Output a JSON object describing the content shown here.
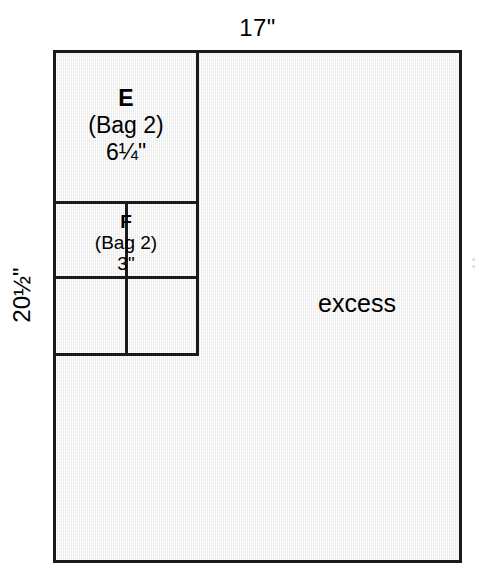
{
  "diagram": {
    "type": "cutting-layout",
    "material": {
      "width_label": "17\"",
      "height_label": "20½\"",
      "fill_color": "#ebebeb",
      "border_color": "#1a1a1a"
    },
    "pieces": [
      {
        "id": "E",
        "bag": "(Bag 2)",
        "size": "6¼\"",
        "shape": "square",
        "count": 1,
        "position": "top-left"
      },
      {
        "id": "F",
        "bag": "(Bag 2)",
        "size": "3\"",
        "shape": "square",
        "count": 4,
        "position": "below-E",
        "grid": "2x2"
      }
    ],
    "excess_label": "excess",
    "edge_artifact": "• • •"
  }
}
